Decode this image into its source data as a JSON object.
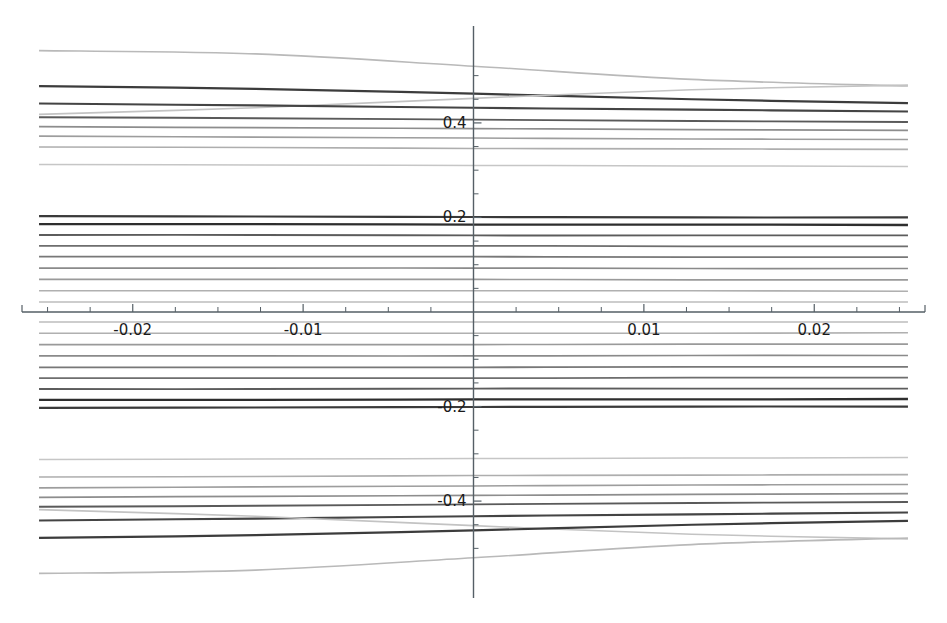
{
  "chart_data": {
    "type": "line",
    "title": "",
    "subtitle": "",
    "xlabel": "",
    "ylabel": "",
    "xlim": [
      -0.0265,
      0.0265
    ],
    "ylim": [
      -0.605,
      0.605
    ],
    "grid": false,
    "legend": "none",
    "background": "#ffffff",
    "axis_style": "spines-at-zero",
    "x_ticks_major": [
      -0.02,
      -0.01,
      0.01,
      0.02
    ],
    "x_tick_labels": [
      "-0.02",
      "-0.01",
      "0.01",
      "0.02"
    ],
    "x_ticks_minor": [
      -0.025,
      -0.0225,
      -0.0175,
      -0.015,
      -0.0125,
      -0.0075,
      -0.005,
      -0.0025,
      0.0025,
      0.005,
      0.0075,
      0.0125,
      0.015,
      0.0175,
      0.0225,
      0.025
    ],
    "y_ticks_major": [
      -0.4,
      -0.2,
      0.2,
      0.4
    ],
    "y_tick_labels": [
      "-0.4",
      "-0.2",
      "0.2",
      "0.4"
    ],
    "y_ticks_minor": [
      -0.5,
      -0.45,
      -0.35,
      -0.3,
      -0.25,
      -0.15,
      -0.1,
      -0.05,
      0.05,
      0.1,
      0.15,
      0.25,
      0.3,
      0.35,
      0.45,
      0.5
    ],
    "x_range_sampled": [
      -0.0255,
      0.0255
    ],
    "series": [
      {
        "name": "level-01",
        "color": "#b9b9b9",
        "width": 1.6,
        "x": [
          -0.0255,
          -0.0128,
          0.0,
          0.0128,
          0.0255
        ],
        "values": [
          0.553,
          0.546,
          0.52,
          0.492,
          0.478
        ]
      },
      {
        "name": "level-02",
        "color": "#3c3c3c",
        "width": 2.2,
        "x": [
          -0.0255,
          -0.0128,
          0.0,
          0.0128,
          0.0255
        ],
        "values": [
          0.478,
          0.472,
          0.462,
          0.45,
          0.442
        ]
      },
      {
        "name": "level-03",
        "color": "#c3c3c3",
        "width": 1.6,
        "x": [
          -0.0255,
          -0.0128,
          0.0,
          0.0128,
          0.0255
        ],
        "values": [
          0.418,
          0.432,
          0.452,
          0.47,
          0.48
        ]
      },
      {
        "name": "level-04",
        "color": "#444444",
        "width": 2.1,
        "x": [
          -0.0255,
          -0.0128,
          0.0,
          0.0128,
          0.0255
        ],
        "values": [
          0.441,
          0.437,
          0.432,
          0.428,
          0.424
        ]
      },
      {
        "name": "level-05",
        "color": "#5a5a5a",
        "width": 1.9,
        "x": [
          -0.0255,
          -0.0128,
          0.0,
          0.0128,
          0.0255
        ],
        "values": [
          0.412,
          0.41,
          0.407,
          0.404,
          0.402
        ]
      },
      {
        "name": "level-06",
        "color": "#8d8d8d",
        "width": 1.7,
        "x": [
          -0.0255,
          -0.0128,
          0.0,
          0.0128,
          0.0255
        ],
        "values": [
          0.392,
          0.39,
          0.388,
          0.386,
          0.384
        ]
      },
      {
        "name": "level-07",
        "color": "#9d9d9d",
        "width": 1.6,
        "x": [
          -0.0255,
          -0.0128,
          0.0,
          0.0128,
          0.0255
        ],
        "values": [
          0.372,
          0.37,
          0.368,
          0.366,
          0.365
        ]
      },
      {
        "name": "level-08",
        "color": "#aeaeae",
        "width": 1.6,
        "x": [
          -0.0255,
          -0.0128,
          0.0,
          0.0128,
          0.0255
        ],
        "values": [
          0.349,
          0.348,
          0.346,
          0.345,
          0.344
        ]
      },
      {
        "name": "level-09",
        "color": "#c6c6c6",
        "width": 1.5,
        "x": [
          -0.0255,
          -0.0128,
          0.0,
          0.0128,
          0.0255
        ],
        "values": [
          0.312,
          0.311,
          0.31,
          0.309,
          0.308
        ]
      },
      {
        "name": "level-10",
        "color": "#3a3a3a",
        "width": 2.2,
        "x": [
          -0.0255,
          -0.0128,
          0.0,
          0.0128,
          0.0255
        ],
        "values": [
          0.203,
          0.202,
          0.201,
          0.2,
          0.2
        ]
      },
      {
        "name": "level-11",
        "color": "#2e2e2e",
        "width": 2.3,
        "x": [
          -0.0255,
          -0.0128,
          0.0,
          0.0128,
          0.0255
        ],
        "values": [
          0.186,
          0.186,
          0.185,
          0.185,
          0.184
        ]
      },
      {
        "name": "level-12",
        "color": "#5c5c5c",
        "width": 1.9,
        "x": [
          -0.0255,
          -0.0128,
          0.0,
          0.0128,
          0.0255
        ],
        "values": [
          0.163,
          0.163,
          0.162,
          0.162,
          0.162
        ]
      },
      {
        "name": "level-13",
        "color": "#6e6e6e",
        "width": 1.8,
        "x": [
          -0.0255,
          -0.0128,
          0.0,
          0.0128,
          0.0255
        ],
        "values": [
          0.14,
          0.14,
          0.14,
          0.139,
          0.139
        ]
      },
      {
        "name": "level-14",
        "color": "#787878",
        "width": 1.8,
        "x": [
          -0.0255,
          -0.0128,
          0.0,
          0.0128,
          0.0255
        ],
        "values": [
          0.117,
          0.117,
          0.117,
          0.116,
          0.116
        ]
      },
      {
        "name": "level-15",
        "color": "#8a8a8a",
        "width": 1.7,
        "x": [
          -0.0255,
          -0.0128,
          0.0,
          0.0128,
          0.0255
        ],
        "values": [
          0.093,
          0.093,
          0.093,
          0.092,
          0.092
        ]
      },
      {
        "name": "level-16",
        "color": "#9a9a9a",
        "width": 1.6,
        "x": [
          -0.0255,
          -0.0128,
          0.0,
          0.0128,
          0.0255
        ],
        "values": [
          0.069,
          0.069,
          0.069,
          0.068,
          0.068
        ]
      },
      {
        "name": "level-17",
        "color": "#b0b0b0",
        "width": 1.6,
        "x": [
          -0.0255,
          -0.0128,
          0.0,
          0.0128,
          0.0255
        ],
        "values": [
          0.045,
          0.045,
          0.045,
          0.045,
          0.044
        ]
      },
      {
        "name": "level-18",
        "color": "#bdbdbd",
        "width": 1.5,
        "x": [
          -0.0255,
          -0.0128,
          0.0,
          0.0128,
          0.0255
        ],
        "values": [
          0.021,
          0.021,
          0.021,
          0.021,
          0.021
        ]
      },
      {
        "name": "level-19",
        "color": "#bdbdbd",
        "width": 1.5,
        "x": [
          -0.0255,
          -0.0128,
          0.0,
          0.0128,
          0.0255
        ],
        "values": [
          -0.021,
          -0.021,
          -0.021,
          -0.021,
          -0.021
        ]
      },
      {
        "name": "level-20",
        "color": "#b0b0b0",
        "width": 1.6,
        "x": [
          -0.0255,
          -0.0128,
          0.0,
          0.0128,
          0.0255
        ],
        "values": [
          -0.045,
          -0.045,
          -0.045,
          -0.045,
          -0.044
        ]
      },
      {
        "name": "level-21",
        "color": "#9a9a9a",
        "width": 1.6,
        "x": [
          -0.0255,
          -0.0128,
          0.0,
          0.0128,
          0.0255
        ],
        "values": [
          -0.069,
          -0.069,
          -0.069,
          -0.068,
          -0.068
        ]
      },
      {
        "name": "level-22",
        "color": "#8a8a8a",
        "width": 1.7,
        "x": [
          -0.0255,
          -0.0128,
          0.0,
          0.0128,
          0.0255
        ],
        "values": [
          -0.093,
          -0.093,
          -0.093,
          -0.092,
          -0.092
        ]
      },
      {
        "name": "level-23",
        "color": "#787878",
        "width": 1.8,
        "x": [
          -0.0255,
          -0.0128,
          0.0,
          0.0128,
          0.0255
        ],
        "values": [
          -0.117,
          -0.117,
          -0.117,
          -0.116,
          -0.116
        ]
      },
      {
        "name": "level-24",
        "color": "#6e6e6e",
        "width": 1.8,
        "x": [
          -0.0255,
          -0.0128,
          0.0,
          0.0128,
          0.0255
        ],
        "values": [
          -0.14,
          -0.14,
          -0.14,
          -0.139,
          -0.139
        ]
      },
      {
        "name": "level-25",
        "color": "#5c5c5c",
        "width": 1.9,
        "x": [
          -0.0255,
          -0.0128,
          0.0,
          0.0128,
          0.0255
        ],
        "values": [
          -0.163,
          -0.163,
          -0.162,
          -0.162,
          -0.162
        ]
      },
      {
        "name": "level-26",
        "color": "#2e2e2e",
        "width": 2.3,
        "x": [
          -0.0255,
          -0.0128,
          0.0,
          0.0128,
          0.0255
        ],
        "values": [
          -0.186,
          -0.186,
          -0.185,
          -0.185,
          -0.184
        ]
      },
      {
        "name": "level-27",
        "color": "#3a3a3a",
        "width": 2.2,
        "x": [
          -0.0255,
          -0.0128,
          0.0,
          0.0128,
          0.0255
        ],
        "values": [
          -0.203,
          -0.202,
          -0.201,
          -0.2,
          -0.2
        ]
      },
      {
        "name": "level-28",
        "color": "#c6c6c6",
        "width": 1.5,
        "x": [
          -0.0255,
          -0.0128,
          0.0,
          0.0128,
          0.0255
        ],
        "values": [
          -0.312,
          -0.311,
          -0.31,
          -0.309,
          -0.308
        ]
      },
      {
        "name": "level-29",
        "color": "#aeaeae",
        "width": 1.6,
        "x": [
          -0.0255,
          -0.0128,
          0.0,
          0.0128,
          0.0255
        ],
        "values": [
          -0.349,
          -0.348,
          -0.346,
          -0.345,
          -0.344
        ]
      },
      {
        "name": "level-30",
        "color": "#9d9d9d",
        "width": 1.6,
        "x": [
          -0.0255,
          -0.0128,
          0.0,
          0.0128,
          0.0255
        ],
        "values": [
          -0.372,
          -0.37,
          -0.368,
          -0.366,
          -0.365
        ]
      },
      {
        "name": "level-31",
        "color": "#8d8d8d",
        "width": 1.7,
        "x": [
          -0.0255,
          -0.0128,
          0.0,
          0.0128,
          0.0255
        ],
        "values": [
          -0.392,
          -0.39,
          -0.388,
          -0.386,
          -0.384
        ]
      },
      {
        "name": "level-32",
        "color": "#5a5a5a",
        "width": 1.9,
        "x": [
          -0.0255,
          -0.0128,
          0.0,
          0.0128,
          0.0255
        ],
        "values": [
          -0.412,
          -0.41,
          -0.407,
          -0.404,
          -0.402
        ]
      },
      {
        "name": "level-33",
        "color": "#444444",
        "width": 2.1,
        "x": [
          -0.0255,
          -0.0128,
          0.0,
          0.0128,
          0.0255
        ],
        "values": [
          -0.441,
          -0.437,
          -0.432,
          -0.428,
          -0.424
        ]
      },
      {
        "name": "level-34",
        "color": "#c3c3c3",
        "width": 1.6,
        "x": [
          -0.0255,
          -0.0128,
          0.0,
          0.0128,
          0.0255
        ],
        "values": [
          -0.418,
          -0.432,
          -0.452,
          -0.47,
          -0.48
        ]
      },
      {
        "name": "level-35",
        "color": "#3c3c3c",
        "width": 2.2,
        "x": [
          -0.0255,
          -0.0128,
          0.0,
          0.0128,
          0.0255
        ],
        "values": [
          -0.478,
          -0.472,
          -0.462,
          -0.45,
          -0.442
        ]
      },
      {
        "name": "level-36",
        "color": "#b9b9b9",
        "width": 1.6,
        "x": [
          -0.0255,
          -0.0128,
          0.0,
          0.0128,
          0.0255
        ],
        "values": [
          -0.553,
          -0.546,
          -0.52,
          -0.492,
          -0.478
        ]
      }
    ]
  }
}
